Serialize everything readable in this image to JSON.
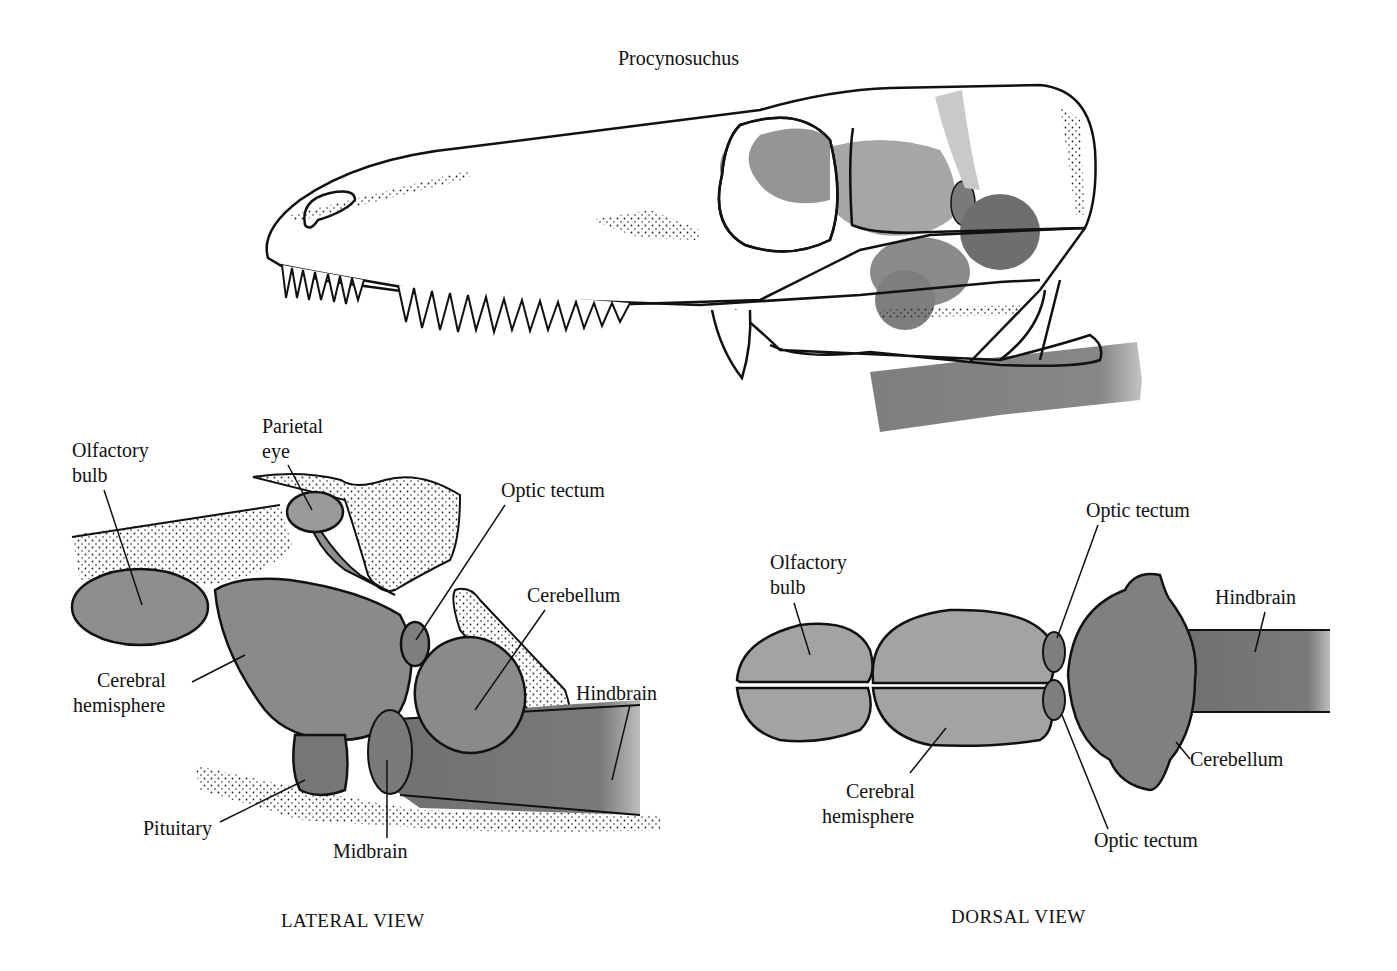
{
  "figure": {
    "title": "Procynosuchus",
    "colors": {
      "background": "#ffffff",
      "outline": "#111111",
      "brain_fill": "#8c8c8c",
      "brain_dark": "#6e6e6e",
      "bone_stipple": "#222222"
    }
  },
  "lateral_view": {
    "caption": "LATERAL VIEW",
    "labels": {
      "olfactory_bulb": [
        "Olfactory",
        "bulb"
      ],
      "parietal_eye": [
        "Parietal",
        "eye"
      ],
      "optic_tectum": "Optic tectum",
      "cerebellum": "Cerebellum",
      "cerebral_hemisphere": [
        "Cerebral",
        "hemisphere"
      ],
      "hindbrain": "Hindbrain",
      "pituitary": "Pituitary",
      "midbrain": "Midbrain"
    }
  },
  "dorsal_view": {
    "caption": "DORSAL VIEW",
    "labels": {
      "optic_tectum_top": "Optic tectum",
      "olfactory_bulb": [
        "Olfactory",
        "bulb"
      ],
      "hindbrain": "Hindbrain",
      "cerebellum": "Cerebellum",
      "cerebral_hemisphere": [
        "Cerebral",
        "hemisphere"
      ],
      "optic_tectum_bottom": "Optic tectum"
    }
  }
}
